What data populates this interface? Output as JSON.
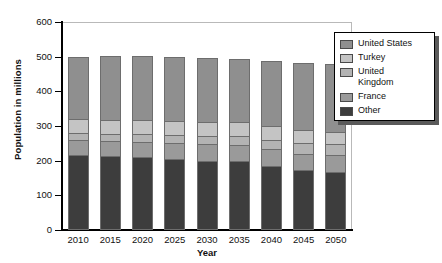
{
  "chart_data": {
    "type": "bar",
    "stacked": true,
    "title": "",
    "xlabel": "Year",
    "ylabel": "Population in millions",
    "categories": [
      "2010",
      "2015",
      "2020",
      "2025",
      "2030",
      "2035",
      "2040",
      "2045",
      "2050"
    ],
    "ylim": [
      0,
      600
    ],
    "yticks": [
      0,
      100,
      200,
      300,
      400,
      500,
      600
    ],
    "grid": false,
    "legend_position": "right",
    "series": [
      {
        "name": "Other",
        "color": "#3d3d3d",
        "values": [
          215,
          213,
          210,
          205,
          200,
          198,
          185,
          172,
          168
        ]
      },
      {
        "name": "France",
        "color": "#9a9a9a",
        "values": [
          45,
          45,
          45,
          46,
          47,
          47,
          48,
          48,
          48
        ]
      },
      {
        "name": "United Kingdom",
        "color": "#b3b3b3",
        "values": [
          20,
          20,
          22,
          23,
          25,
          26,
          28,
          30,
          31
        ]
      },
      {
        "name": "Turkey",
        "color": "#c4c4c4",
        "values": [
          40,
          40,
          40,
          40,
          40,
          40,
          40,
          38,
          37
        ]
      },
      {
        "name": "United States",
        "color": "#8f8f8f",
        "values": [
          180,
          184,
          185,
          184,
          184,
          182,
          186,
          194,
          196
        ]
      }
    ],
    "totals": [
      500,
      502,
      502,
      498,
      496,
      493,
      487,
      482,
      480
    ]
  },
  "legend": {
    "items": [
      {
        "label": "United States",
        "color": "#8f8f8f"
      },
      {
        "label": "Turkey",
        "color": "#c4c4c4"
      },
      {
        "label": "United\nKingdom",
        "color": "#b3b3b3"
      },
      {
        "label": "France",
        "color": "#9a9a9a"
      },
      {
        "label": "Other",
        "color": "#3d3d3d"
      }
    ]
  }
}
